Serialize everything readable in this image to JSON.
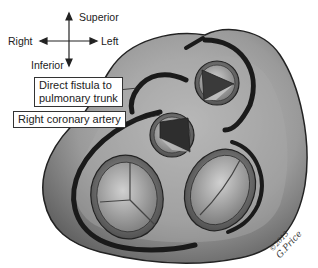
{
  "orientation": {
    "superior": "Superior",
    "inferior": "Inferior",
    "right": "Right",
    "left": "Left"
  },
  "labels": {
    "fistula_line1": "Direct fistula to",
    "fistula_line2": "pulmonary trunk",
    "right_coronary": "Right coronary artery"
  },
  "signature": {
    "copyright": "©2013",
    "artist": "G.Price"
  },
  "structures": [
    "pulmonary-valve",
    "aortic-valve",
    "tricuspid-valve",
    "mitral-valve",
    "right-coronary-artery",
    "left-coronary-artery",
    "direct-fistula"
  ],
  "colors": {
    "heart_fill": "#8a8a8a",
    "heart_highlight": "#c8c8c8",
    "vessel": "#1a1a1a",
    "outline": "#222222"
  }
}
